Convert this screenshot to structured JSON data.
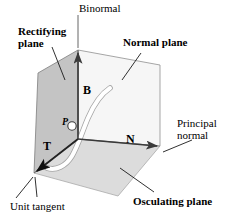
{
  "figure": {
    "title_alt": "Frenet-Serret frame: TNB frame at a point P on a space curve",
    "background": "#ffffff"
  },
  "labels": {
    "binormal": "Binormal",
    "rectifying_plane": "Rectifying\nplane",
    "normal_plane": "Normal plane",
    "principal_normal": "Principal\nnormal",
    "osculating_plane": "Osculating plane",
    "unit_tangent": "Unit tangent"
  },
  "vectors": {
    "binormal_symbol": "B",
    "normal_symbol": "N",
    "tangent_symbol": "T"
  },
  "points": {
    "point_p": "P"
  },
  "colors": {
    "rectifying_plane_fill": "#c4c4c4",
    "normal_plane_fill": "#f6f6f6",
    "osculating_plane_fill": "#dcdcdc",
    "stroke": "#000000",
    "edge_gray": "#888888",
    "curve_fill": "#ffffff",
    "curve_stroke": "#9a9a9a",
    "leader_line": "#1a1a1a"
  },
  "geometry": {
    "top_vertex": [
      78,
      50
    ],
    "left_vertex": [
      38,
      73
    ],
    "center_vertex": [
      78,
      139
    ],
    "right_vertex": [
      160,
      146
    ],
    "normal_plane_top_right": [
      160,
      65
    ],
    "tangent_arrow_tip": [
      34,
      173
    ],
    "binormal_arrow_tip": [
      78,
      50
    ],
    "osculating_far_vertex": [
      118,
      196
    ]
  }
}
